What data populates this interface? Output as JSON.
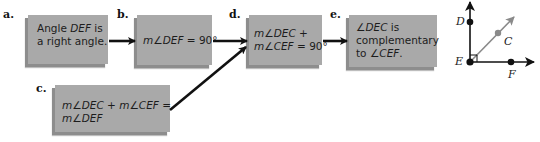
{
  "steps": {
    "a": {
      "label": "a.",
      "lines": [
        "Angle DEF is",
        "a right angle."
      ]
    },
    "b": {
      "label": "b.",
      "lines": [
        "m∠DEF = 90°"
      ]
    },
    "c": {
      "label": "c.",
      "lines": [
        "m∠DEC + m∠CEF =",
        "m∠DEF"
      ]
    },
    "d": {
      "label": "d.",
      "lines": [
        "m∠DEC +",
        "m∠CEF = 90°"
      ]
    },
    "e": {
      "label": "e.",
      "lines": [
        "∠DEC is",
        "complementary",
        "to ∠CEF."
      ]
    }
  },
  "flow": [
    {
      "from": "a",
      "to": "b"
    },
    {
      "from": "b",
      "to": "d"
    },
    {
      "from": "c",
      "to": "d"
    },
    {
      "from": "d",
      "to": "e"
    }
  ],
  "figure": {
    "points": {
      "D": "D",
      "E": "E",
      "C": "C",
      "F": "F"
    },
    "right_angle_at": "E"
  },
  "colors": {
    "box_fill": "#a9a9a9",
    "box_shadow": "#8d8d8d",
    "arrow": "#111111",
    "ray_EC": "#8a8a8a"
  }
}
